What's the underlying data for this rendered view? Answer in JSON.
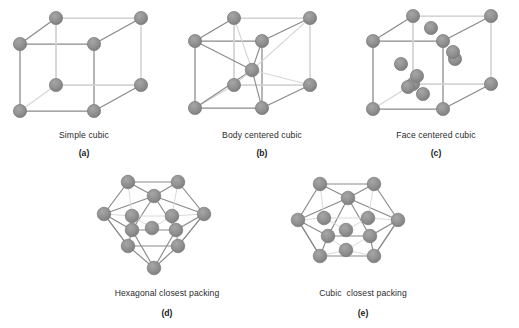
{
  "figure": {
    "background_color": "#ffffff",
    "sphere_color": "#8c8c8c",
    "sphere_edge_color": "#7a7a7a",
    "edge_color": "#8a8a8a",
    "hidden_edge_color": "#d6d6d6",
    "label_color": "#2b2b2b",
    "panels": [
      {
        "id": "simple-cubic",
        "label": "Simple cubic",
        "letter": "(a)",
        "type": "cubic-lattice",
        "atom_count": 8,
        "description": "Cube with one sphere at each of the eight corners."
      },
      {
        "id": "body-centered-cubic",
        "label": "Body centered cubic",
        "letter": "(b)",
        "type": "cubic-lattice",
        "atom_count": 9,
        "description": "Cube with eight corner spheres plus one sphere at the body center, joined by diagonals."
      },
      {
        "id": "face-centered-cubic",
        "label": "Face centered cubic",
        "letter": "(c)",
        "type": "cubic-lattice",
        "atom_count": 14,
        "description": "Cube with eight corner spheres plus one sphere at the center of each of the six faces."
      },
      {
        "id": "hexagonal-closest-packing",
        "label": "Hexagonal closest packing",
        "letter": "(d)",
        "type": "closest-packing",
        "atom_count": 17,
        "description": "Hexagonal outline with a central sphere ringed by six spheres and capping spheres above and below."
      },
      {
        "id": "cubic-closest-packing",
        "label": "Cubic  closest packing",
        "letter": "(e)",
        "type": "closest-packing",
        "atom_count": 17,
        "description": "Hexagonal outline with a central sphere ringed by six spheres, offset layer stacking."
      }
    ],
    "footer_fragment": " "
  }
}
